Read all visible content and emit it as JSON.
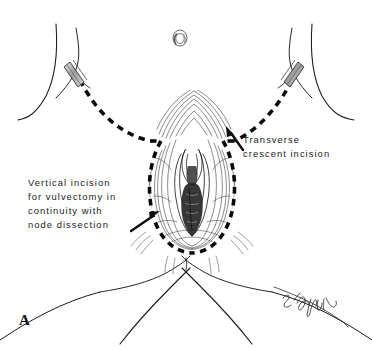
{
  "figure": {
    "panel_letter": "A",
    "background_color": "#ffffff",
    "ink_color": "#1a1a1a",
    "type": "medical-line-illustration"
  },
  "annotations": [
    {
      "id": "transverse-crescent-incision",
      "lines": [
        "Transverse",
        "crescent incision"
      ],
      "arrow": {
        "points_to": "dashed crescent line above right groin",
        "direction": "up-left",
        "tail_x": 244,
        "tail_y": 149,
        "tip_x": 228,
        "tip_y": 128
      }
    },
    {
      "id": "vertical-incision-vulvectomy",
      "lines": [
        "Vertical incision",
        "for vulvectomy in",
        "continuity with",
        "node dissection"
      ],
      "arrow": {
        "points_to": "left edge of teardrop dashed vulvar outline",
        "direction": "up-right",
        "tail_x": 130,
        "tail_y": 230,
        "tip_x": 158,
        "tip_y": 212
      }
    }
  ],
  "landmarks": [
    {
      "id": "umbilicus",
      "label": "umbilicus",
      "x": 180,
      "y": 38
    },
    {
      "id": "left-groin-marker",
      "label": "left inguinal skin marker",
      "x": 76,
      "y": 77
    },
    {
      "id": "right-groin-marker",
      "label": "right inguinal skin marker",
      "x": 287,
      "y": 77
    },
    {
      "id": "vulva",
      "label": "vulva",
      "x": 192,
      "y": 190
    },
    {
      "id": "mons-pubis",
      "label": "mons pubis",
      "x": 196,
      "y": 120
    }
  ],
  "incision_lines": [
    {
      "id": "transverse-crescent",
      "style": "heavy-dashed",
      "description": "wide downward crescent sweeping from left groin across pubis to right groin"
    },
    {
      "id": "vertical-teardrop",
      "style": "heavy-dashed",
      "description": "inverted teardrop encircling the vulva, continuous with the crescent"
    }
  ],
  "signature": {
    "id": "artist-signature",
    "text": "cursive artist signature",
    "x": 297,
    "y": 300
  }
}
